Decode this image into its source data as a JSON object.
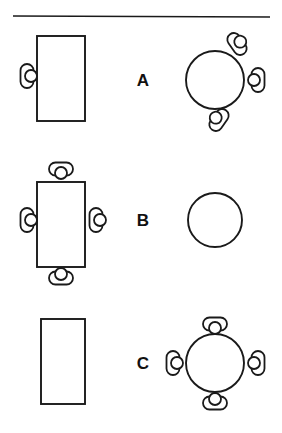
{
  "figure": {
    "width": 282,
    "height": 433,
    "background_color": "#ffffff",
    "line_color": "#1a1a1a"
  },
  "divider": {
    "name": "top-horizontal-rule",
    "x1": 13,
    "y1": 16,
    "x2": 270,
    "y2": 17
  },
  "rows": [
    {
      "label": "A",
      "label_x": 143,
      "label_y": 80,
      "rect_table": {
        "x": 37,
        "y": 36,
        "width": 48,
        "height": 85
      },
      "round_table": {
        "cx": 215,
        "cy": 80,
        "r": 29
      },
      "rect_people": [
        {
          "cx": 27,
          "cy": 76,
          "rotation": 0,
          "head_side": "right"
        }
      ],
      "round_people": [
        {
          "cx": 237,
          "cy": 44,
          "rotation": -35,
          "head_side": "right"
        },
        {
          "cx": 258,
          "cy": 80,
          "rotation": 0,
          "head_side": "left"
        },
        {
          "cx": 219,
          "cy": 120,
          "rotation": 35,
          "head_side": "left"
        }
      ],
      "rect_seat_count": 1,
      "round_seat_count": 3
    },
    {
      "label": "B",
      "label_x": 143,
      "label_y": 220,
      "rect_table": {
        "x": 37,
        "y": 182,
        "width": 48,
        "height": 85
      },
      "round_table": {
        "cx": 215,
        "cy": 220,
        "r": 27
      },
      "rect_people": [
        {
          "cx": 61,
          "cy": 169,
          "rotation": 90,
          "head_side": "bottom"
        },
        {
          "cx": 27,
          "cy": 220,
          "rotation": 0,
          "head_side": "right"
        },
        {
          "cx": 96,
          "cy": 220,
          "rotation": 0,
          "head_side": "right"
        },
        {
          "cx": 61,
          "cy": 278,
          "rotation": 90,
          "head_side": "top"
        }
      ],
      "round_people": [],
      "rect_seat_count": 4,
      "round_seat_count": 0
    },
    {
      "label": "C",
      "label_x": 143,
      "label_y": 363,
      "rect_table": {
        "x": 41,
        "y": 319,
        "width": 44,
        "height": 85
      },
      "round_table": {
        "cx": 215,
        "cy": 363,
        "r": 29
      },
      "rect_people": [],
      "round_people": [
        {
          "cx": 215,
          "cy": 324,
          "rotation": 90,
          "head_side": "bottom"
        },
        {
          "cx": 173,
          "cy": 363,
          "rotation": 0,
          "head_side": "right"
        },
        {
          "cx": 258,
          "cy": 363,
          "rotation": 0,
          "head_side": "left"
        },
        {
          "cx": 215,
          "cy": 403,
          "rotation": 90,
          "head_side": "top"
        }
      ],
      "rect_seat_count": 0,
      "round_seat_count": 4
    }
  ],
  "person_glyph": {
    "body_width": 13,
    "body_height": 24,
    "body_radius": 6.5,
    "head_radius": 6,
    "head_offset": 4
  }
}
